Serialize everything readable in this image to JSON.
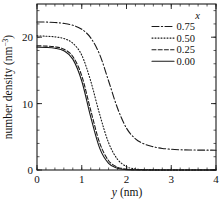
{
  "chart_data": {
    "type": "line",
    "title": "",
    "xlabel": "y (nm)",
    "xlabel_symbol": "y",
    "xlabel_unit": "(nm)",
    "ylabel": "number density (nm-3)",
    "ylabel_main": "number density (nm",
    "ylabel_exp": "-3",
    "ylabel_tail": ")",
    "xlim": [
      0,
      4
    ],
    "ylim": [
      0,
      25
    ],
    "xticks": [
      0,
      1,
      2,
      3,
      4
    ],
    "xticklabels": [
      "0",
      "1",
      "2",
      "3",
      "4"
    ],
    "yticks": [
      0,
      10,
      20
    ],
    "yticklabels": [
      "0",
      "10",
      "20"
    ],
    "x_minor_interval": 0.2,
    "y_minor_interval": 2,
    "grid": false,
    "legend_position": "upper right",
    "legend_title": "x",
    "series": [
      {
        "name": "0.75",
        "label": "0.75",
        "linestyle": "dashdot",
        "color": "#1a1a1a",
        "plateau": 22.3,
        "tail": 3.0,
        "midpoint": 1.62,
        "width": 0.42,
        "x": [
          0.0,
          0.2,
          0.4,
          0.6,
          0.8,
          1.0,
          1.2,
          1.4,
          1.6,
          1.8,
          2.0,
          2.2,
          2.4,
          2.6,
          2.8,
          3.0,
          3.2,
          3.4,
          3.6,
          3.8,
          4.0
        ],
        "y": [
          22.3,
          22.28,
          22.22,
          22.08,
          21.8,
          21.2,
          19.9,
          17.4,
          13.4,
          9.3,
          6.3,
          4.7,
          3.9,
          3.5,
          3.25,
          3.12,
          3.05,
          3.01,
          3.0,
          2.99,
          2.98
        ]
      },
      {
        "name": "0.50",
        "label": "0.50",
        "linestyle": "dotted",
        "color": "#1a1a1a",
        "plateau": 20.2,
        "tail": 0.0,
        "midpoint": 1.33,
        "width": 0.33,
        "x": [
          0.0,
          0.2,
          0.4,
          0.6,
          0.8,
          1.0,
          1.2,
          1.4,
          1.6,
          1.8,
          2.0,
          2.1,
          2.2,
          2.4,
          2.6,
          3.0,
          3.5,
          4.0
        ],
        "y": [
          20.2,
          20.15,
          20.05,
          19.8,
          19.1,
          17.3,
          13.4,
          8.4,
          4.1,
          1.6,
          0.5,
          0.28,
          0.15,
          0.05,
          0.02,
          0.0,
          0.0,
          0.0
        ]
      },
      {
        "name": "0.25",
        "label": "0.25",
        "linestyle": "dashed",
        "color": "#1a1a1a",
        "plateau": 18.7,
        "tail": 0.0,
        "midpoint": 1.16,
        "width": 0.29,
        "x": [
          0.0,
          0.2,
          0.4,
          0.6,
          0.8,
          1.0,
          1.2,
          1.4,
          1.6,
          1.8,
          1.9,
          2.0,
          2.1,
          2.2,
          2.6,
          3.0,
          4.0
        ],
        "y": [
          18.7,
          18.66,
          18.55,
          18.2,
          17.1,
          14.2,
          9.0,
          4.1,
          1.4,
          0.42,
          0.25,
          0.14,
          0.07,
          0.03,
          0.0,
          0.0,
          0.0
        ]
      },
      {
        "name": "0.00",
        "label": "0.00",
        "linestyle": "solid",
        "color": "#1a1a1a",
        "plateau": 18.5,
        "tail": 0.0,
        "midpoint": 1.13,
        "width": 0.27,
        "x": [
          0.0,
          0.2,
          0.4,
          0.6,
          0.8,
          1.0,
          1.2,
          1.4,
          1.6,
          1.8,
          1.9,
          2.0,
          2.2,
          2.6,
          3.0,
          4.0
        ],
        "y": [
          18.5,
          18.46,
          18.34,
          17.95,
          16.7,
          13.4,
          8.0,
          3.3,
          1.0,
          0.25,
          0.13,
          0.06,
          0.01,
          0.0,
          0.0,
          0.0
        ]
      }
    ]
  },
  "legend": {
    "title": "x",
    "entries": [
      {
        "label": "0.75",
        "linestyle": "dashdot"
      },
      {
        "label": "0.50",
        "linestyle": "dotted"
      },
      {
        "label": "0.25",
        "linestyle": "dashed"
      },
      {
        "label": "0.00",
        "linestyle": "solid"
      }
    ]
  },
  "axes": {
    "x_label_symbol": "y",
    "x_label_unit": "(nm)",
    "y_label_text": "number density (nm",
    "y_label_exp": "−3",
    "y_label_close": ")",
    "xticklabels": [
      "0",
      "1",
      "2",
      "3",
      "4"
    ],
    "yticklabels": [
      "0",
      "10",
      "20"
    ]
  }
}
